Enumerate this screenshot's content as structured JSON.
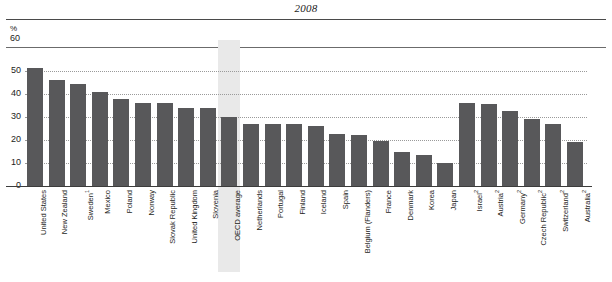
{
  "chart_data": {
    "type": "bar",
    "title": "2008",
    "xlabel": "",
    "ylabel": "%",
    "unit_label": "%",
    "ylim": [
      0,
      60
    ],
    "yticks": [
      0,
      10,
      20,
      30,
      40,
      50,
      60
    ],
    "grid": true,
    "legend": null,
    "highlight_category": "OECD average",
    "bar_color": "#58585a",
    "highlight_color": "#e9e9e9",
    "categories": [
      "United States",
      "New Zealand",
      "Sweden",
      "Mexico",
      "Poland",
      "Norway",
      "Slovak Republic",
      "United Kingdom",
      "Slovenia",
      "OECD average",
      "Netherlands",
      "Portugal",
      "Finland",
      "Iceland",
      "Spain",
      "Belgium (Flanders)",
      "France",
      "Denmark",
      "Korea",
      "Japan",
      "Israel",
      "Austria",
      "Germany",
      "Czech Republic",
      "Switzerland",
      "Australia"
    ],
    "footnotes": {
      "Sweden": "1",
      "Israel": "2",
      "Austria": "2",
      "Germany": "2",
      "Czech Republic": "2",
      "Switzerland": "2",
      "Australia": "2"
    },
    "values": [
      51.5,
      46.0,
      44.5,
      41.0,
      38.0,
      36.0,
      36.0,
      34.0,
      34.0,
      30.0,
      27.0,
      27.0,
      27.0,
      26.0,
      22.5,
      22.0,
      19.5,
      15.0,
      13.5,
      10.0,
      36.0,
      35.5,
      32.5,
      29.0,
      27.0,
      19.0
    ]
  }
}
